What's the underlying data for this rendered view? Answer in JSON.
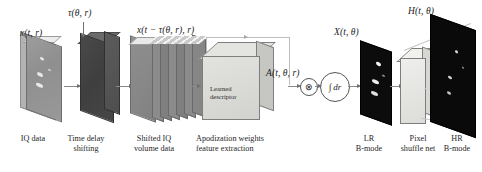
{
  "figure": {
    "type": "pipeline-diagram",
    "domain": "ultrasound beamforming neural network",
    "background": "#ffffff"
  },
  "math_labels": {
    "iq_data": "x(t, r)",
    "time_delay": "τ(θ, r)",
    "shifted_iq": "x(t − τ(θ, r), r)",
    "apodization": "A(t, θ, r)",
    "lr_bmode": "X(t, θ)",
    "hr_bmode": "H(t, θ)"
  },
  "operators": {
    "multiply": "⊗",
    "integral": "∫ dr"
  },
  "cube_text": {
    "line1": "Learned",
    "line2": "descriptor"
  },
  "captions": [
    {
      "id": "iq-data",
      "line1": "IQ data",
      "line2": ""
    },
    {
      "id": "time-delay",
      "line1": "Time delay",
      "line2": "shifting"
    },
    {
      "id": "shifted-iq",
      "line1": "Shifted IQ",
      "line2": "volume data"
    },
    {
      "id": "apodization",
      "line1": "Apodization weights",
      "line2": "feature extraction"
    },
    {
      "id": "lr-bmode",
      "line1": "LR",
      "line2": "B-mode"
    },
    {
      "id": "pixel-shuffle",
      "line1": "Pixel",
      "line2": "shuffle net"
    },
    {
      "id": "hr-bmode",
      "line1": "HR",
      "line2": "B-mode"
    }
  ],
  "colors": {
    "iq_plane": "#9a9a9a",
    "delay_block": "#4f4f4f",
    "shifted_sheet": "#7d7d7d",
    "cube_front": "#d9d9d6",
    "bmode_black": "#0b0b0b",
    "arrow": "#8a8a8a"
  }
}
